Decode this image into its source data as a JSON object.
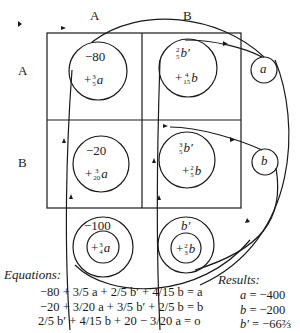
{
  "columns": [
    "A",
    "B"
  ],
  "rows": [
    "A",
    "B"
  ],
  "cells": {
    "AA": {
      "top": "−80",
      "bottom_sign": "+",
      "bottom_num": "3",
      "bottom_den": "5",
      "bottom_var": "a"
    },
    "AB": {
      "top_num": "2",
      "top_den": "5",
      "top_var": "b′",
      "bottom_sign": "+",
      "bottom_num": "4",
      "bottom_den": "15",
      "bottom_var": "b"
    },
    "BA": {
      "top": "−20",
      "bottom_sign": "+",
      "bottom_num": "3",
      "bottom_den": "20",
      "bottom_var": "a"
    },
    "BB": {
      "top_num": "3",
      "top_den": "5",
      "top_var": "b′",
      "bottom_sign": "+",
      "bottom_num": "2",
      "bottom_den": "5",
      "bottom_var": "b"
    }
  },
  "nodes": {
    "a": "a",
    "b": "b",
    "col_a_total": {
      "top": "−100",
      "inner_sign": "+",
      "inner_num": "3",
      "inner_den": "4",
      "inner_var": "a"
    },
    "col_b_total": {
      "top": "b′",
      "inner_sign": "+",
      "inner_num": "2",
      "inner_den": "3",
      "inner_var": "b"
    }
  },
  "equations_title": "Equations:",
  "equations": [
    {
      "text": "−80 + 3/5 a + 2/5 b′ + 4/15 b = a"
    },
    {
      "text": "−20 + 3/20 a + 3/5 b′ + 2/5 b = b"
    },
    {
      "text": "2/5 b′ + 4/15 b + 20 − 3/20 a = o"
    }
  ],
  "results_title": "Results:",
  "results": [
    {
      "var": "a",
      "value": "−400"
    },
    {
      "var": "b",
      "value": "−200"
    },
    {
      "var": "b′",
      "value": "−66⅔"
    }
  ]
}
